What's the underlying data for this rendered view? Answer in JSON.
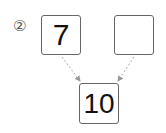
{
  "problem": {
    "marker": "②",
    "left_box": {
      "value": "7"
    },
    "right_box": {
      "value": ""
    },
    "result_box": {
      "value": "10"
    }
  },
  "colors": {
    "border": "#666666",
    "arrow": "#999999",
    "text": "#111111"
  }
}
